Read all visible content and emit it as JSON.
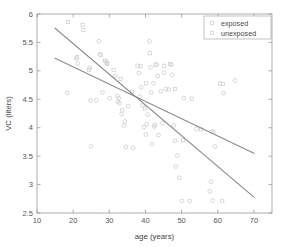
{
  "chart_data": {
    "type": "scatter",
    "title": "",
    "xlabel": "age (years)",
    "ylabel": "VC (liters)",
    "xlim": [
      10,
      75
    ],
    "ylim": [
      2.5,
      6
    ],
    "xticks": [
      10,
      20,
      30,
      40,
      50,
      60,
      70
    ],
    "xtick_labels": [
      "10",
      "20",
      "30",
      "40",
      "50",
      "60",
      "70"
    ],
    "yticks": [
      2.5,
      3,
      3.5,
      4,
      4.5,
      5,
      5.5,
      6
    ],
    "ytick_labels": [
      "2.5",
      "3",
      "3.5",
      "4",
      "4.5",
      "5",
      "5.5",
      "6"
    ],
    "grid": false,
    "legend_position": "top-right",
    "marker_color": "#c9c9c9",
    "line_color": "#8d8d8d",
    "axis_color": "#9a9a9a",
    "series": [
      {
        "name": "exposed",
        "marker": "circle",
        "points": [
          [
            18.4,
            4.61
          ],
          [
            20.8,
            5.22
          ],
          [
            21.2,
            5.13
          ],
          [
            24.6,
            5.05
          ],
          [
            24.8,
            4.48
          ],
          [
            24.9,
            3.67
          ],
          [
            26.4,
            4.48
          ],
          [
            27.1,
            5.52
          ],
          [
            27.4,
            5.29
          ],
          [
            28.1,
            4.62
          ],
          [
            29.2,
            5.16
          ],
          [
            29.4,
            5.14
          ],
          [
            30.1,
            4.52
          ],
          [
            31.6,
            4.91
          ],
          [
            32.2,
            4.56
          ],
          [
            32.4,
            4.46
          ],
          [
            32.6,
            4.52
          ],
          [
            32.8,
            4.43
          ],
          [
            33.4,
            4.24
          ],
          [
            33.6,
            4.31
          ],
          [
            34.1,
            4.04
          ],
          [
            34.3,
            4.11
          ],
          [
            34.6,
            3.66
          ],
          [
            35.2,
            4.38
          ],
          [
            36.6,
            3.65
          ],
          [
            37.8,
            5.09
          ],
          [
            38.2,
            4.96
          ],
          [
            38.4,
            4.55
          ],
          [
            38.8,
            4.71
          ],
          [
            39.2,
            4.39
          ],
          [
            39.6,
            4.01
          ],
          [
            40.1,
            3.88
          ],
          [
            40.4,
            4.06
          ],
          [
            40.6,
            4.23
          ],
          [
            41.1,
            5.52
          ],
          [
            41.4,
            5.06
          ],
          [
            41.6,
            4.62
          ],
          [
            41.8,
            3.71
          ],
          [
            42.2,
            4.78
          ],
          [
            42.4,
            4.02
          ],
          [
            42.6,
            4.05
          ],
          [
            43.1,
            5.11
          ],
          [
            43.4,
            4.91
          ],
          [
            43.6,
            3.87
          ],
          [
            44.2,
            4.64
          ],
          [
            44.6,
            4.08
          ],
          [
            45.1,
            4.97
          ],
          [
            45.6,
            4.68
          ],
          [
            46.4,
            4.67
          ],
          [
            47.2,
            5.11
          ],
          [
            47.4,
            4.93
          ],
          [
            47.8,
            4.04
          ],
          [
            48.2,
            3.77
          ],
          [
            48.4,
            3.32
          ],
          [
            48.8,
            3.51
          ],
          [
            49.4,
            3.12
          ],
          [
            50.1,
            2.71
          ],
          [
            50.6,
            4.52
          ],
          [
            52.2,
            2.71
          ],
          [
            54.1,
            3.98
          ],
          [
            57.8,
            2.88
          ],
          [
            58.2,
            3.05
          ],
          [
            58.4,
            3.93
          ],
          [
            58.6,
            2.72
          ],
          [
            59.2,
            3.67
          ],
          [
            61.2,
            2.71
          ],
          [
            61.6,
            4.61
          ],
          [
            64.8,
            4.83
          ]
        ]
      },
      {
        "name": "unexposed",
        "marker": "square",
        "points": [
          [
            18.6,
            5.86
          ],
          [
            21.1,
            5.24
          ],
          [
            22.6,
            5.81
          ],
          [
            22.8,
            5.72
          ],
          [
            24.4,
            5.02
          ],
          [
            27.6,
            5.28
          ],
          [
            28.8,
            5.18
          ],
          [
            29.4,
            5.12
          ],
          [
            31.2,
            5.02
          ],
          [
            33.1,
            4.86
          ],
          [
            36.2,
            4.63
          ],
          [
            38.6,
            5.08
          ],
          [
            39.8,
            4.34
          ],
          [
            40.2,
            4.78
          ],
          [
            41.2,
            5.31
          ],
          [
            42.8,
            5.11
          ],
          [
            45.2,
            5.09
          ],
          [
            46.8,
            5.12
          ],
          [
            48.2,
            4.68
          ],
          [
            50.4,
            3.78
          ],
          [
            52.8,
            4.51
          ],
          [
            55.4,
            3.97
          ],
          [
            58.8,
            3.93
          ],
          [
            60.6,
            4.78
          ],
          [
            61.4,
            4.77
          ]
        ]
      }
    ],
    "fit_lines": [
      {
        "name": "exposed-fit",
        "x0": 15,
        "y0": 5.75,
        "x1": 70,
        "y1": 2.78
      },
      {
        "name": "unexposed-fit",
        "x0": 15,
        "y0": 5.22,
        "x1": 70,
        "y1": 3.55
      }
    ]
  },
  "legend": {
    "entries": [
      {
        "label": "exposed",
        "marker": "circle"
      },
      {
        "label": "unexposed",
        "marker": "square"
      }
    ]
  }
}
